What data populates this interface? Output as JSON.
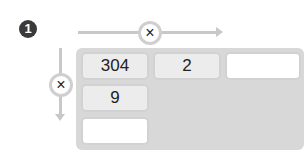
{
  "problem": {
    "number": "1",
    "horizontal_operator": "×",
    "vertical_operator": "×",
    "top_row": [
      "304",
      "2",
      ""
    ],
    "left_column": [
      "9",
      ""
    ]
  }
}
